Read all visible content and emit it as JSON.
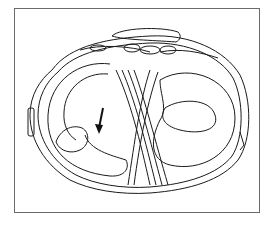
{
  "figure": {
    "type": "anatomical line drawing",
    "annotations": [
      {
        "kind": "arrow",
        "direction": "down",
        "target": "torn flap of medial meniscus"
      }
    ],
    "colors": {
      "ink": "#1a1a1a",
      "frame": "#6a6a6a",
      "background": "#ffffff"
    }
  }
}
